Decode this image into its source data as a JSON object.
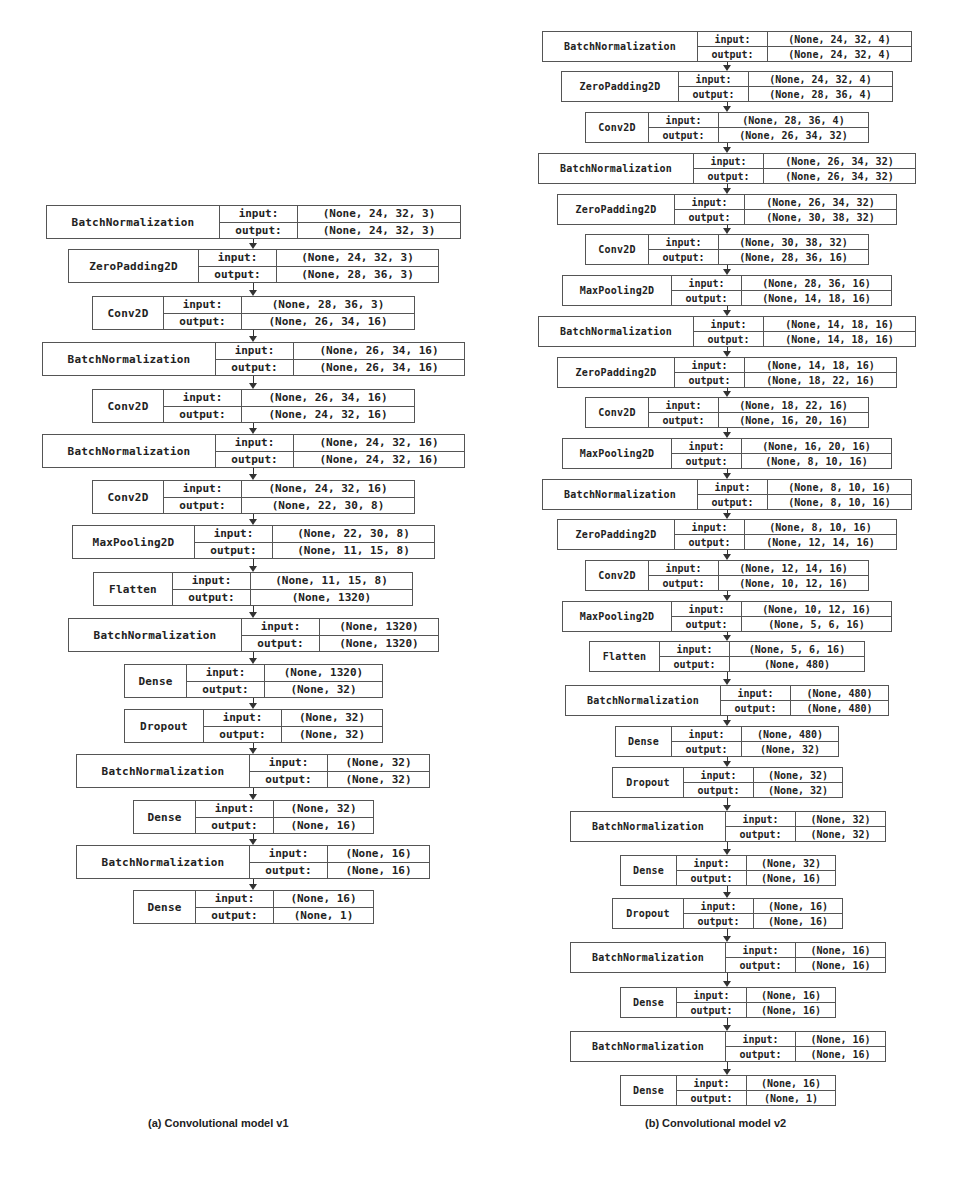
{
  "figure": {
    "panels": [
      {
        "id": "a",
        "caption": "(a) Convolutional model v1",
        "caption_pos": {
          "x": 148,
          "y": 1117
        },
        "arrow_x": 253,
        "font_size": 11,
        "box_height": 34,
        "layers": [
          {
            "name": "BatchNormalization",
            "input": "(None, 24, 32, 3)",
            "output": "(None, 24, 32, 3)",
            "x": 46,
            "y": 205,
            "w": 415,
            "split1": 172,
            "split2": 77
          },
          {
            "name": "ZeroPadding2D",
            "input": "(None, 24, 32, 3)",
            "output": "(None, 28, 36, 3)",
            "x": 68,
            "y": 249,
            "w": 371,
            "split1": 129,
            "split2": 77
          },
          {
            "name": "Conv2D",
            "input": "(None, 28, 36, 3)",
            "output": "(None, 26, 34, 16)",
            "x": 92,
            "y": 296,
            "w": 323,
            "split1": 70,
            "split2": 77
          },
          {
            "name": "BatchNormalization",
            "input": "(None, 26, 34, 16)",
            "output": "(None, 26, 34, 16)",
            "x": 42,
            "y": 342,
            "w": 423,
            "split1": 172,
            "split2": 77
          },
          {
            "name": "Conv2D",
            "input": "(None, 26, 34, 16)",
            "output": "(None, 24, 32, 16)",
            "x": 92,
            "y": 389,
            "w": 323,
            "split1": 70,
            "split2": 77
          },
          {
            "name": "BatchNormalization",
            "input": "(None, 24, 32, 16)",
            "output": "(None, 24, 32, 16)",
            "x": 42,
            "y": 434,
            "w": 423,
            "split1": 172,
            "split2": 77
          },
          {
            "name": "Conv2D",
            "input": "(None, 24, 32, 16)",
            "output": "(None, 22, 30, 8)",
            "x": 92,
            "y": 480,
            "w": 323,
            "split1": 70,
            "split2": 77
          },
          {
            "name": "MaxPooling2D",
            "input": "(None, 22, 30, 8)",
            "output": "(None, 11, 15, 8)",
            "x": 72,
            "y": 525,
            "w": 363,
            "split1": 121,
            "split2": 77
          },
          {
            "name": "Flatten",
            "input": "(None, 11, 15, 8)",
            "output": "(None, 1320)",
            "x": 93,
            "y": 572,
            "w": 320,
            "split1": 78,
            "split2": 77
          },
          {
            "name": "BatchNormalization",
            "input": "(None, 1320)",
            "output": "(None, 1320)",
            "x": 68,
            "y": 618,
            "w": 371,
            "split1": 172,
            "split2": 77
          },
          {
            "name": "Dense",
            "input": "(None, 1320)",
            "output": "(None, 32)",
            "x": 124,
            "y": 664,
            "w": 259,
            "split1": 61,
            "split2": 77
          },
          {
            "name": "Dropout",
            "input": "(None, 32)",
            "output": "(None, 32)",
            "x": 124,
            "y": 709,
            "w": 259,
            "split1": 78,
            "split2": 77
          },
          {
            "name": "BatchNormalization",
            "input": "(None, 32)",
            "output": "(None, 32)",
            "x": 76,
            "y": 754,
            "w": 354,
            "split1": 172,
            "split2": 77
          },
          {
            "name": "Dense",
            "input": "(None, 32)",
            "output": "(None, 16)",
            "x": 133,
            "y": 800,
            "w": 241,
            "split1": 61,
            "split2": 77
          },
          {
            "name": "BatchNormalization",
            "input": "(None, 16)",
            "output": "(None, 16)",
            "x": 76,
            "y": 845,
            "w": 354,
            "split1": 172,
            "split2": 77
          },
          {
            "name": "Dense",
            "input": "(None, 16)",
            "output": "(None, 1)",
            "x": 133,
            "y": 890,
            "w": 241,
            "split1": 61,
            "split2": 77
          }
        ]
      },
      {
        "id": "b",
        "caption": "(b) Convolutional model v2",
        "caption_pos": {
          "x": 645,
          "y": 1117
        },
        "arrow_x": 727,
        "font_size": 10,
        "box_height": 31,
        "layers": [
          {
            "name": "BatchNormalization",
            "input": "(None, 24, 32, 4)",
            "output": "(None, 24, 32, 4)",
            "x": 542,
            "y": 31,
            "w": 370,
            "split1": 154,
            "split2": 69
          },
          {
            "name": "ZeroPadding2D",
            "input": "(None, 24, 32, 4)",
            "output": "(None, 28, 36, 4)",
            "x": 561,
            "y": 71,
            "w": 332,
            "split1": 116,
            "split2": 69
          },
          {
            "name": "Conv2D",
            "input": "(None, 28, 36, 4)",
            "output": "(None, 26, 34, 32)",
            "x": 585,
            "y": 112,
            "w": 284,
            "split1": 62,
            "split2": 69
          },
          {
            "name": "BatchNormalization",
            "input": "(None, 26, 34, 32)",
            "output": "(None, 26, 34, 32)",
            "x": 538,
            "y": 153,
            "w": 378,
            "split1": 154,
            "split2": 69
          },
          {
            "name": "ZeroPadding2D",
            "input": "(None, 26, 34, 32)",
            "output": "(None, 30, 38, 32)",
            "x": 557,
            "y": 194,
            "w": 340,
            "split1": 116,
            "split2": 69
          },
          {
            "name": "Conv2D",
            "input": "(None, 30, 38, 32)",
            "output": "(None, 28, 36, 16)",
            "x": 585,
            "y": 234,
            "w": 284,
            "split1": 62,
            "split2": 69
          },
          {
            "name": "MaxPooling2D",
            "input": "(None, 28, 36, 16)",
            "output": "(None, 14, 18, 16)",
            "x": 562,
            "y": 275,
            "w": 330,
            "split1": 108,
            "split2": 69
          },
          {
            "name": "BatchNormalization",
            "input": "(None, 14, 18, 16)",
            "output": "(None, 14, 18, 16)",
            "x": 538,
            "y": 316,
            "w": 378,
            "split1": 154,
            "split2": 69
          },
          {
            "name": "ZeroPadding2D",
            "input": "(None, 14, 18, 16)",
            "output": "(None, 18, 22, 16)",
            "x": 557,
            "y": 357,
            "w": 340,
            "split1": 116,
            "split2": 69
          },
          {
            "name": "Conv2D",
            "input": "(None, 18, 22, 16)",
            "output": "(None, 16, 20, 16)",
            "x": 585,
            "y": 397,
            "w": 284,
            "split1": 62,
            "split2": 69
          },
          {
            "name": "MaxPooling2D",
            "input": "(None, 16, 20, 16)",
            "output": "(None, 8, 10, 16)",
            "x": 562,
            "y": 438,
            "w": 330,
            "split1": 108,
            "split2": 69
          },
          {
            "name": "BatchNormalization",
            "input": "(None, 8, 10, 16)",
            "output": "(None, 8, 10, 16)",
            "x": 542,
            "y": 479,
            "w": 370,
            "split1": 154,
            "split2": 69
          },
          {
            "name": "ZeroPadding2D",
            "input": "(None, 8, 10, 16)",
            "output": "(None, 12, 14, 16)",
            "x": 557,
            "y": 519,
            "w": 340,
            "split1": 116,
            "split2": 69
          },
          {
            "name": "Conv2D",
            "input": "(None, 12, 14, 16)",
            "output": "(None, 10, 12, 16)",
            "x": 585,
            "y": 560,
            "w": 284,
            "split1": 62,
            "split2": 69
          },
          {
            "name": "MaxPooling2D",
            "input": "(None, 10, 12, 16)",
            "output": "(None, 5, 6, 16)",
            "x": 562,
            "y": 601,
            "w": 330,
            "split1": 108,
            "split2": 69
          },
          {
            "name": "Flatten",
            "input": "(None, 5, 6, 16)",
            "output": "(None, 480)",
            "x": 589,
            "y": 641,
            "w": 276,
            "split1": 69,
            "split2": 69
          },
          {
            "name": "BatchNormalization",
            "input": "(None, 480)",
            "output": "(None, 480)",
            "x": 565,
            "y": 685,
            "w": 324,
            "split1": 154,
            "split2": 69
          },
          {
            "name": "Dense",
            "input": "(None, 480)",
            "output": "(None, 32)",
            "x": 615,
            "y": 726,
            "w": 224,
            "split1": 55,
            "split2": 69
          },
          {
            "name": "Dropout",
            "input": "(None, 32)",
            "output": "(None, 32)",
            "x": 612,
            "y": 767,
            "w": 231,
            "split1": 70,
            "split2": 69
          },
          {
            "name": "BatchNormalization",
            "input": "(None, 32)",
            "output": "(None, 32)",
            "x": 570,
            "y": 811,
            "w": 316,
            "split1": 154,
            "split2": 69
          },
          {
            "name": "Dense",
            "input": "(None, 32)",
            "output": "(None, 16)",
            "x": 620,
            "y": 855,
            "w": 216,
            "split1": 55,
            "split2": 69
          },
          {
            "name": "Dropout",
            "input": "(None, 16)",
            "output": "(None, 16)",
            "x": 612,
            "y": 898,
            "w": 231,
            "split1": 70,
            "split2": 69
          },
          {
            "name": "BatchNormalization",
            "input": "(None, 16)",
            "output": "(None, 16)",
            "x": 570,
            "y": 942,
            "w": 316,
            "split1": 154,
            "split2": 69
          },
          {
            "name": "Dense",
            "input": "(None, 16)",
            "output": "(None, 16)",
            "x": 620,
            "y": 987,
            "w": 216,
            "split1": 55,
            "split2": 69
          },
          {
            "name": "BatchNormalization",
            "input": "(None, 16)",
            "output": "(None, 16)",
            "x": 570,
            "y": 1031,
            "w": 316,
            "split1": 154,
            "split2": 69
          },
          {
            "name": "Dense",
            "input": "(None, 16)",
            "output": "(None, 1)",
            "x": 620,
            "y": 1075,
            "w": 216,
            "split1": 55,
            "split2": 69
          }
        ]
      }
    ],
    "labels": {
      "input_key": "input:",
      "output_key": "output:"
    },
    "colors": {
      "border": "#555555",
      "text": "#222222",
      "arrow": "#333333",
      "background": "#ffffff"
    }
  }
}
